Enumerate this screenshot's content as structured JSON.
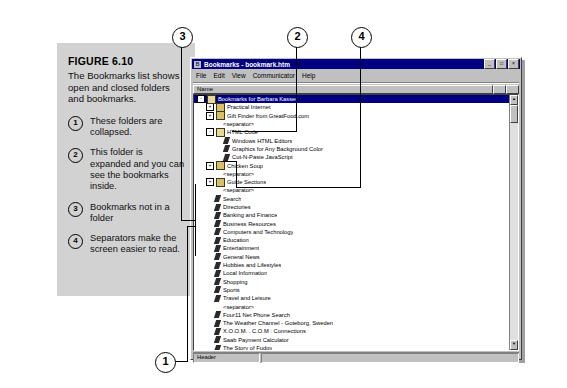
{
  "figure": {
    "label": "FIGURE 6.10",
    "description": "The Bookmarks list shows open and closed folders and bookmarks.",
    "notes": [
      {
        "num": "1",
        "text": "These folders are collapsed."
      },
      {
        "num": "2",
        "text": "This folder is expanded and you can see the bookmarks inside."
      },
      {
        "num": "3",
        "text": "Bookmarks not in a folder"
      },
      {
        "num": "4",
        "text": "Separators make the screen easier to read."
      }
    ]
  },
  "callouts": [
    {
      "num": "3"
    },
    {
      "num": "2"
    },
    {
      "num": "4"
    },
    {
      "num": "1"
    }
  ],
  "window": {
    "title": "Bookmarks - bookmark.htm",
    "title_icon": "bookmark-icon",
    "buttons": {
      "minimize": "_",
      "maximize": "□",
      "close": "×"
    },
    "menus": [
      "File",
      "Edit",
      "View",
      "Communicator",
      "Help"
    ],
    "columns": [
      "Name",
      ""
    ],
    "status": {
      "cell": "Header",
      "rest": ""
    }
  },
  "tree": {
    "rows": [
      {
        "depth": 0,
        "twisty": "-",
        "icon": "folder-open-icon",
        "label": "Bookmarks for Barbara Kasser",
        "selected": true
      },
      {
        "depth": 1,
        "twisty": "+",
        "icon": "folder-icon",
        "label": "Practical Internet",
        "selected": false
      },
      {
        "depth": 1,
        "twisty": "+",
        "icon": "folder-icon",
        "label": "Gift Finder from GreatFood.com",
        "selected": false
      },
      {
        "depth": 1,
        "twisty": "",
        "icon": "separator-icon",
        "label": "<separator>",
        "selected": false
      },
      {
        "depth": 1,
        "twisty": "-",
        "icon": "folder-open-icon",
        "label": "HTML Code",
        "selected": false
      },
      {
        "depth": 2,
        "twisty": "",
        "icon": "bookmark-icon",
        "label": "Windows HTML Editors",
        "selected": false
      },
      {
        "depth": 2,
        "twisty": "",
        "icon": "bookmark-icon",
        "label": "Graphics for Any Background Color",
        "selected": false
      },
      {
        "depth": 2,
        "twisty": "",
        "icon": "bookmark-icon",
        "label": "Cut-N-Paste JavaScript",
        "selected": false
      },
      {
        "depth": 1,
        "twisty": "+",
        "icon": "folder-icon",
        "label": "Chicken Soup",
        "selected": false
      },
      {
        "depth": 1,
        "twisty": "",
        "icon": "separator-icon",
        "label": "<separator>",
        "selected": false
      },
      {
        "depth": 1,
        "twisty": "+",
        "icon": "folder-icon",
        "label": "Guide Sections",
        "selected": false
      },
      {
        "depth": 1,
        "twisty": "",
        "icon": "separator-icon",
        "label": "<separator>",
        "selected": false
      },
      {
        "depth": 1,
        "twisty": "",
        "icon": "bookmark-icon",
        "label": "Search",
        "selected": false
      },
      {
        "depth": 1,
        "twisty": "",
        "icon": "bookmark-icon",
        "label": "Directories",
        "selected": false
      },
      {
        "depth": 1,
        "twisty": "",
        "icon": "bookmark-icon",
        "label": "Banking and Finance",
        "selected": false
      },
      {
        "depth": 1,
        "twisty": "",
        "icon": "bookmark-icon",
        "label": "Business Resources",
        "selected": false
      },
      {
        "depth": 1,
        "twisty": "",
        "icon": "bookmark-icon",
        "label": "Computers and Technology",
        "selected": false
      },
      {
        "depth": 1,
        "twisty": "",
        "icon": "bookmark-icon",
        "label": "Education",
        "selected": false
      },
      {
        "depth": 1,
        "twisty": "",
        "icon": "bookmark-icon",
        "label": "Entertainment",
        "selected": false
      },
      {
        "depth": 1,
        "twisty": "",
        "icon": "bookmark-icon",
        "label": "General News",
        "selected": false
      },
      {
        "depth": 1,
        "twisty": "",
        "icon": "bookmark-icon",
        "label": "Hobbies and Lifestyles",
        "selected": false
      },
      {
        "depth": 1,
        "twisty": "",
        "icon": "bookmark-icon",
        "label": "Local Information",
        "selected": false
      },
      {
        "depth": 1,
        "twisty": "",
        "icon": "bookmark-icon",
        "label": "Shopping",
        "selected": false
      },
      {
        "depth": 1,
        "twisty": "",
        "icon": "bookmark-icon",
        "label": "Sports",
        "selected": false
      },
      {
        "depth": 1,
        "twisty": "",
        "icon": "bookmark-icon",
        "label": "Travel and Leisure",
        "selected": false
      },
      {
        "depth": 1,
        "twisty": "",
        "icon": "separator-icon",
        "label": "<separator>",
        "selected": false
      },
      {
        "depth": 1,
        "twisty": "",
        "icon": "bookmark-icon",
        "label": "Four11 Net Phone Search",
        "selected": false
      },
      {
        "depth": 1,
        "twisty": "",
        "icon": "bookmark-icon",
        "label": "The Weather Channel - Goteborg, Sweden",
        "selected": false
      },
      {
        "depth": 1,
        "twisty": "",
        "icon": "bookmark-icon",
        "label": "X.O.O.M. . C.O.M : Connections",
        "selected": false
      },
      {
        "depth": 1,
        "twisty": "",
        "icon": "bookmark-icon",
        "label": "Saab Payment Calculator",
        "selected": false
      },
      {
        "depth": 1,
        "twisty": "",
        "icon": "bookmark-icon",
        "label": "The Story of Fudgy",
        "selected": false
      },
      {
        "depth": 1,
        "twisty": "",
        "icon": "bookmark-icon",
        "label": "Stouffer's Family Favorites",
        "selected": false
      }
    ]
  },
  "colors": {
    "titlebar": "#000080",
    "window_face": "#c0c0c0",
    "caption_panel": "#d2d2d2",
    "selection": "#000080"
  }
}
